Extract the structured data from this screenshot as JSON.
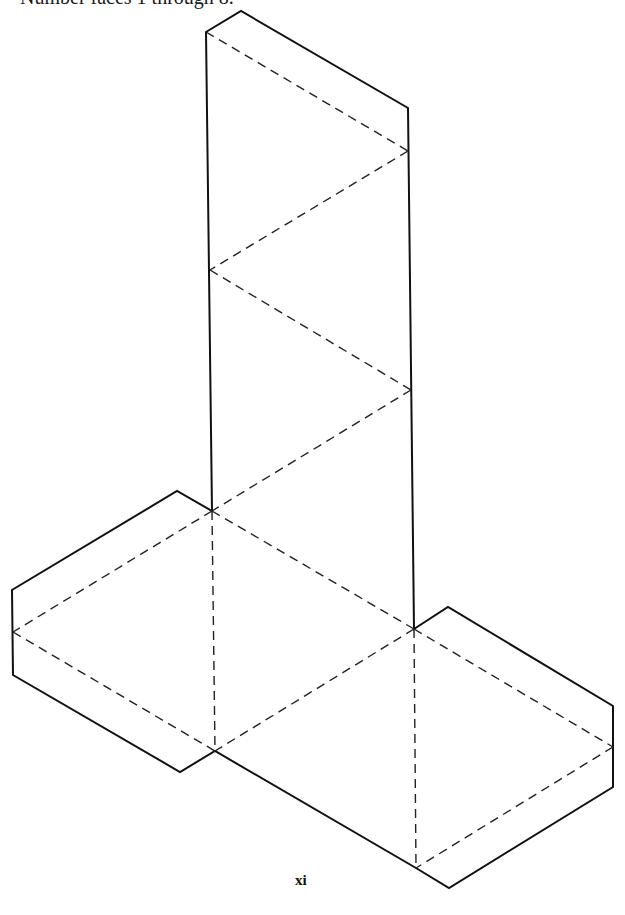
{
  "page": {
    "instruction": "Number faces 1 through 8.",
    "page_number": "xi"
  },
  "figure": {
    "line_legend": {
      "solid": "cut line",
      "dashed": "fold line"
    },
    "line_color": "#111111"
  }
}
